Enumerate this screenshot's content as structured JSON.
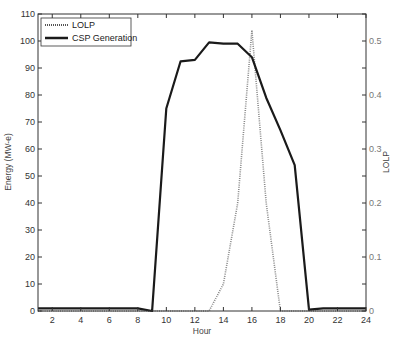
{
  "chart_data": {
    "type": "line",
    "title": "",
    "xlabel": "Hour",
    "ylabel": "Energy (MW-e)",
    "y2label": "LOLP",
    "xlim": [
      1,
      24
    ],
    "ylim": [
      0,
      110
    ],
    "y2lim": [
      0,
      0.55
    ],
    "grid": false,
    "legend_position": "upper left",
    "x_ticks": [
      2,
      4,
      6,
      8,
      10,
      12,
      14,
      16,
      18,
      20,
      22,
      24
    ],
    "y_ticks": [
      0,
      10,
      20,
      30,
      40,
      50,
      60,
      70,
      80,
      90,
      100,
      110
    ],
    "y2_ticks": [
      0,
      0.1,
      0.2,
      0.3,
      0.4,
      0.5
    ],
    "x": [
      1,
      2,
      3,
      4,
      5,
      6,
      7,
      8,
      9,
      10,
      11,
      12,
      13,
      14,
      15,
      16,
      17,
      18,
      19,
      20,
      21,
      22,
      23,
      24
    ],
    "series": [
      {
        "name": "LOLP",
        "axis": "right",
        "style": "dotted",
        "color": "#888888",
        "values": [
          0,
          0,
          0,
          0,
          0,
          0,
          0,
          0,
          0,
          0,
          0,
          0,
          0,
          0.05,
          0.2,
          0.52,
          0.2,
          0,
          0,
          0,
          0,
          0,
          0,
          0
        ]
      },
      {
        "name": "CSP Generation",
        "axis": "left",
        "style": "solid",
        "color": "#1a1a1a",
        "values": [
          1,
          1,
          1,
          1,
          1,
          1,
          1,
          1,
          0,
          75,
          92.5,
          93,
          99.5,
          99,
          99,
          94,
          79,
          67,
          54,
          0.5,
          1,
          1,
          1,
          1
        ]
      }
    ]
  },
  "legend": {
    "items": [
      "LOLP",
      "CSP Generation"
    ]
  }
}
